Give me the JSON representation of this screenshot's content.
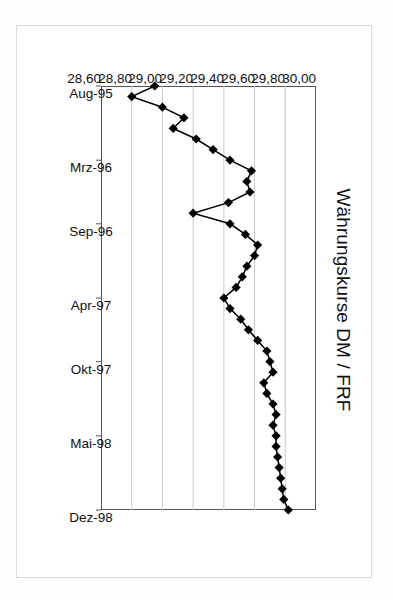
{
  "figure": {
    "title": "Währungskurse DM / FRF"
  },
  "chart_data": {
    "type": "line",
    "title": "Währungskurse DM / FRF",
    "xlabel": "",
    "ylabel": "",
    "orientation": "rotated-90-ccw",
    "grid": true,
    "legend": null,
    "ylim": [
      28.6,
      30.0
    ],
    "yticks": [
      30.0,
      29.8,
      29.6,
      29.4,
      29.2,
      29.0,
      28.8,
      28.6
    ],
    "ytick_labels": [
      "30,00",
      "29,80",
      "29,60",
      "29,40",
      "29,20",
      "29,00",
      "28,80",
      "28,60"
    ],
    "xtick_labels": [
      "Aug-95",
      "Mrz-96",
      "Sep-96",
      "Apr-97",
      "Okt-97",
      "Mai-98",
      "Dez-98"
    ],
    "xtick_index": [
      0,
      7,
      13,
      20,
      26,
      33,
      40
    ],
    "marker": "diamond",
    "series": [
      {
        "name": "DM / FRF",
        "x": [
          "Aug-95",
          "Sep-95",
          "Okt-95",
          "Nov-95",
          "Dez-95",
          "Jan-96",
          "Feb-96",
          "Mrz-96",
          "Apr-96",
          "Mai-96",
          "Jun-96",
          "Jul-96",
          "Aug-96",
          "Sep-96",
          "Okt-96",
          "Nov-96",
          "Dez-96",
          "Jan-97",
          "Feb-97",
          "Mrz-97",
          "Apr-97",
          "Mai-97",
          "Jun-97",
          "Jul-97",
          "Aug-97",
          "Sep-97",
          "Okt-97",
          "Nov-97",
          "Dez-97",
          "Jan-98",
          "Feb-98",
          "Mrz-98",
          "Apr-98",
          "Mai-98",
          "Jun-98",
          "Jul-98",
          "Aug-98",
          "Sep-98",
          "Okt-98",
          "Nov-98",
          "Dez-98"
        ],
        "values": [
          28.95,
          28.8,
          29.0,
          29.14,
          29.07,
          29.22,
          29.33,
          29.44,
          29.58,
          29.55,
          29.57,
          29.43,
          29.2,
          29.44,
          29.54,
          29.62,
          29.6,
          29.55,
          29.52,
          29.48,
          29.4,
          29.44,
          29.51,
          29.56,
          29.62,
          29.68,
          29.7,
          29.72,
          29.66,
          29.68,
          29.72,
          29.74,
          29.72,
          29.74,
          29.74,
          29.75,
          29.76,
          29.77,
          29.78,
          29.79,
          29.82
        ]
      }
    ]
  }
}
